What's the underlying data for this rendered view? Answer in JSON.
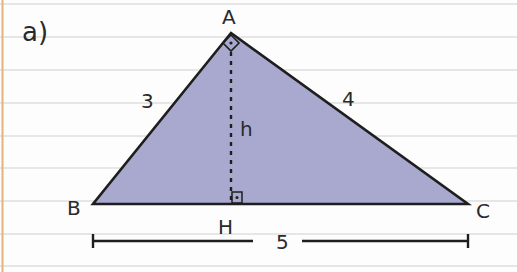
{
  "exercise_label": "a)",
  "colors": {
    "triangle_fill": "#a9a9d0",
    "stroke": "#1e1e1e",
    "rule_line": "#cfcfcf",
    "margin_line": "#e8b07a",
    "paper": "#fdfdfd"
  },
  "triangle": {
    "vertices": {
      "A": {
        "label": "A",
        "x": 231,
        "y": 33
      },
      "B": {
        "label": "B",
        "x": 93,
        "y": 204
      },
      "C": {
        "label": "C",
        "x": 468,
        "y": 204
      }
    },
    "foot": {
      "label": "H",
      "x": 231,
      "y": 204
    },
    "side_labels": {
      "AB": "3",
      "AC": "4",
      "BC": "5"
    },
    "height_label": "h",
    "right_angle_markers": [
      "A",
      "H"
    ]
  },
  "dimension_line": {
    "label": "5",
    "x_start": 93,
    "x_end": 468,
    "y": 241
  }
}
